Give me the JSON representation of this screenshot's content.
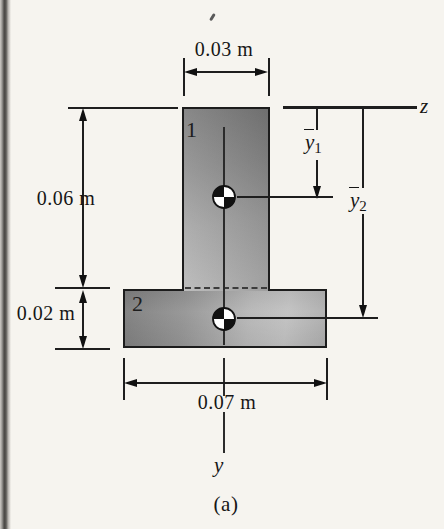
{
  "figure": {
    "caption": "(a)",
    "axis_labels": {
      "z": "z",
      "y": "y"
    },
    "region_labels": {
      "region1": "1",
      "region2": "2"
    },
    "dimensions": {
      "stem_width": "0.03 m",
      "stem_height": "0.06 m",
      "flange_height": "0.02 m",
      "flange_width": "0.07 m"
    },
    "centroid_distances": {
      "ybar1": {
        "base": "y",
        "sub": "1"
      },
      "ybar2": {
        "base": "y",
        "sub": "2"
      }
    },
    "colors": {
      "page_background": "#f6f4ef",
      "outline": "#1c1c1c",
      "shade_dark": "#7b7b7b",
      "shade_light": "#c2c2c2",
      "line": "#1e1e1e"
    }
  }
}
